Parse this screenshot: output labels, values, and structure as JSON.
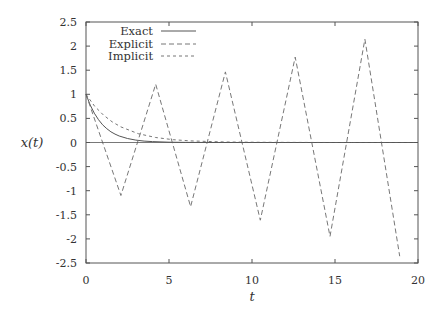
{
  "chart_data": {
    "type": "line",
    "title": "",
    "xlabel": "t",
    "ylabel": "x(t)",
    "xlim": [
      0,
      20
    ],
    "ylim": [
      -2.5,
      2.5
    ],
    "xticks": [
      0,
      5,
      10,
      15,
      20
    ],
    "yticks": [
      -2.5,
      -2,
      -1.5,
      -1,
      -0.5,
      0,
      0.5,
      1,
      1.5,
      2,
      2.5
    ],
    "xtick_labels": [
      "0",
      "5",
      "10",
      "15",
      "20"
    ],
    "ytick_labels": [
      "-2.5",
      "-2",
      "-1.5",
      "-1",
      "-0.5",
      "0",
      "0.5",
      "1",
      "1.5",
      "2",
      "2.5"
    ],
    "grid": false,
    "legend_position": "upper left",
    "series": [
      {
        "name": "Exact",
        "style": "solid",
        "color": "#555555",
        "x": [
          0,
          0.25,
          0.5,
          0.75,
          1,
          1.25,
          1.5,
          1.75,
          2,
          2.5,
          3,
          3.5,
          4,
          5,
          6,
          8,
          10,
          12,
          14,
          16,
          18,
          20
        ],
        "y": [
          1,
          0.779,
          0.607,
          0.472,
          0.368,
          0.287,
          0.223,
          0.174,
          0.135,
          0.082,
          0.05,
          0.03,
          0.018,
          0.007,
          0.002,
          0.0003,
          0,
          0,
          0,
          0,
          0,
          0
        ]
      },
      {
        "name": "Explicit",
        "style": "dashed",
        "color": "#777777",
        "x": [
          0,
          2.1,
          4.2,
          6.3,
          8.4,
          10.5,
          12.6,
          14.7,
          16.8,
          18.9
        ],
        "y": [
          1,
          -1.1,
          1.21,
          -1.331,
          1.464,
          -1.611,
          1.772,
          -1.949,
          2.144,
          -2.358
        ]
      },
      {
        "name": "Implicit",
        "style": "dotted",
        "color": "#777777",
        "x": [
          0,
          0.525,
          1.05,
          1.575,
          2.1,
          3.15,
          4.2,
          5.25,
          6.3,
          8.4,
          10.5,
          12.6,
          14.7,
          16.8,
          18.9,
          20
        ],
        "y": [
          1,
          0.75,
          0.57,
          0.43,
          0.323,
          0.183,
          0.104,
          0.059,
          0.034,
          0.011,
          0.0035,
          0.0011,
          0.0004,
          0.0001,
          0,
          0
        ]
      }
    ]
  },
  "legend": {
    "items": [
      {
        "label": "Exact"
      },
      {
        "label": "Explicit"
      },
      {
        "label": "Implicit"
      }
    ]
  }
}
